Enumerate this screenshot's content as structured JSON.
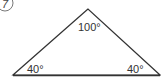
{
  "problem": {
    "number": "7"
  },
  "triangle": {
    "vertices": {
      "apex": [
        88,
        9
      ],
      "left": [
        13,
        75
      ],
      "right": [
        160,
        75
      ]
    },
    "angles": {
      "apex": "100°",
      "left": "40°",
      "right": "40°"
    },
    "stroke_color": "#333333"
  }
}
